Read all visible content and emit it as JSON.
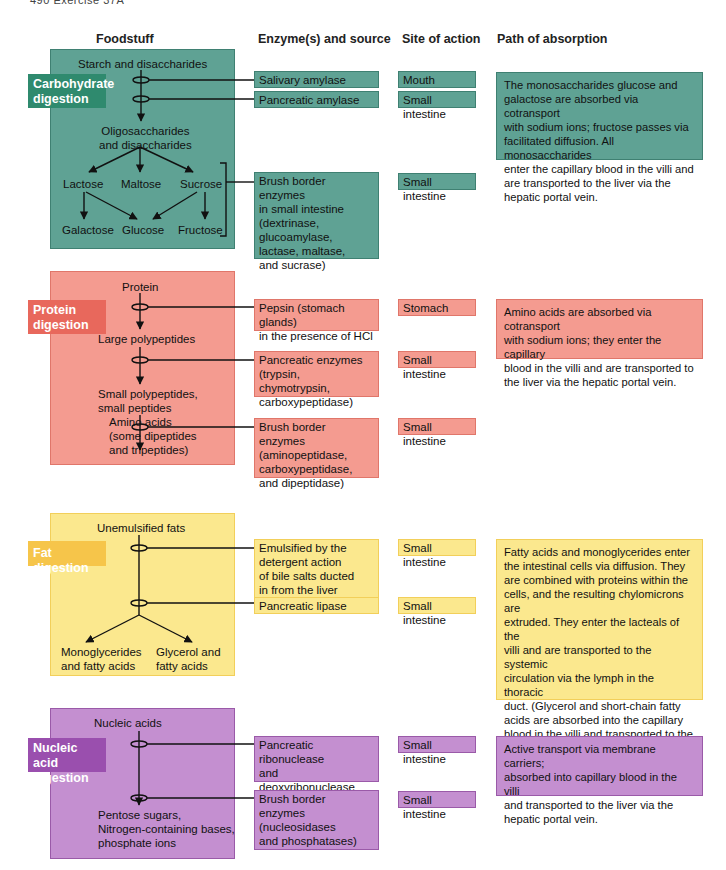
{
  "page": {
    "running_head": "490   Exercise 37A"
  },
  "columns": {
    "foodstuff": "Foodstuff",
    "enzyme": "Enzyme(s) and source",
    "site": "Site of action",
    "absorption": "Path of absorption"
  },
  "sections": {
    "carbohydrate": {
      "label": "Carbohydrate digestion",
      "label_lines": [
        "Carbohydrate",
        "digestion"
      ],
      "color": "#5fa294",
      "flow": {
        "start": "Starch and disaccharides",
        "middle_lines": [
          "Oligosaccharides",
          "and disaccharides"
        ],
        "disaccharides": [
          "Lactose",
          "Maltose",
          "Sucrose"
        ],
        "monosaccharides": [
          "Galactose",
          "Glucose",
          "Fructose"
        ]
      },
      "enzymes": [
        {
          "name_lines": [
            "Salivary amylase"
          ],
          "site": "Mouth"
        },
        {
          "name_lines": [
            "Pancreatic amylase"
          ],
          "site": "Small intestine"
        },
        {
          "name_lines": [
            "Brush border enzymes",
            "in small intestine",
            "(dextrinase,",
            "glucoamylase,",
            "lactase, maltase,",
            "and sucrase)"
          ],
          "site": "Small intestine"
        }
      ],
      "absorption_lines": [
        "The monosaccharides glucose and",
        "galactose are absorbed via cotransport",
        "with sodium ions; fructose passes via",
        "facilitated diffusion. All monosaccharides",
        "enter the capillary blood in the villi and",
        "are transported to the liver via the",
        "hepatic portal vein."
      ]
    },
    "protein": {
      "label_lines": [
        "Protein",
        "digestion"
      ],
      "color": "#f49b90",
      "flow": {
        "start": "Protein",
        "step1": "Large polypeptides",
        "step2_lines": [
          "Small polypeptides,",
          "small peptides"
        ],
        "end_lines": [
          "Amino acids",
          "(some dipeptides",
          "and tripeptides)"
        ]
      },
      "enzymes": [
        {
          "name_lines": [
            "Pepsin (stomach glands)",
            "in the presence of HCl"
          ],
          "site": "Stomach"
        },
        {
          "name_lines": [
            "Pancreatic enzymes",
            "(trypsin, chymotrypsin,",
            "carboxypeptidase)"
          ],
          "site": "Small intestine"
        },
        {
          "name_lines": [
            "Brush border enzymes",
            "(aminopeptidase,",
            "carboxypeptidase,",
            "and dipeptidase)"
          ],
          "site": "Small intestine"
        }
      ],
      "absorption_lines": [
        "Amino acids are absorbed via cotransport",
        "with sodium ions; they enter the capillary",
        "blood in the villi and are transported to",
        "the liver via the hepatic portal vein."
      ]
    },
    "fat": {
      "label_lines": [
        "Fat digestion"
      ],
      "color": "#fbe88e",
      "flow": {
        "start": "Unemulsified fats",
        "end_left_lines": [
          "Monoglycerides",
          "and fatty acids"
        ],
        "end_right_lines": [
          "Glycerol and",
          "fatty acids"
        ]
      },
      "enzymes": [
        {
          "name_lines": [
            "Emulsified by the",
            "detergent action",
            "of bile salts ducted",
            "in from the liver"
          ],
          "site": "Small intestine"
        },
        {
          "name_lines": [
            "Pancreatic lipase"
          ],
          "site": "Small intestine"
        }
      ],
      "absorption_lines": [
        "Fatty acids and monoglycerides enter",
        "the intestinal cells via diffusion. They",
        "are combined with proteins within the",
        "cells, and the resulting chylomicrons are",
        "extruded. They enter the lacteals of the",
        "villi and are transported to the systemic",
        "circulation via the lymph in the thoracic",
        "duct. (Glycerol and short-chain fatty",
        "acids are absorbed into the capillary",
        "blood in the villi and transported to the",
        "liver via the hepatic portal vein.)"
      ]
    },
    "nucleic": {
      "label_lines": [
        "Nucleic acid",
        "digestion"
      ],
      "color": "#c48fd0",
      "flow": {
        "start": "Nucleic acids",
        "end_lines": [
          "Pentose sugars,",
          "Nitrogen-containing bases,",
          "phosphate ions"
        ]
      },
      "enzymes": [
        {
          "name_lines": [
            "Pancreatic",
            "ribonuclease",
            "and deoxyribonuclease"
          ],
          "site": "Small intestine"
        },
        {
          "name_lines": [
            "Brush border",
            "enzymes",
            "(nucleosidases",
            "and phosphatases)"
          ],
          "site": "Small intestine"
        }
      ],
      "absorption_lines": [
        "Active transport via membrane carriers;",
        "absorbed into capillary blood in the villi",
        "and transported to the liver via the",
        "hepatic portal vein."
      ]
    }
  }
}
